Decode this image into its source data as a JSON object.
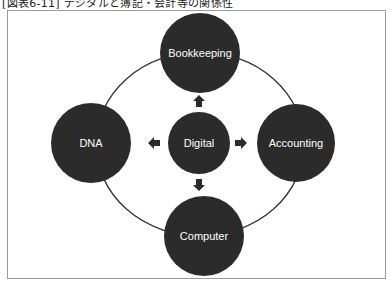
{
  "figure": {
    "title": "[図表6-11] デジタルと簿記・会計等の関係性"
  },
  "diagram": {
    "center_node": {
      "label": "Digital"
    },
    "outer_nodes": [
      {
        "id": "top",
        "label": "Bookkeeping"
      },
      {
        "id": "right",
        "label": "Accounting"
      },
      {
        "id": "bottom",
        "label": "Computer"
      },
      {
        "id": "left",
        "label": "DNA"
      }
    ],
    "arrows": [
      {
        "from": "Digital",
        "to": "Bookkeeping",
        "direction": "up"
      },
      {
        "from": "Digital",
        "to": "Accounting",
        "direction": "right"
      },
      {
        "from": "Digital",
        "to": "Computer",
        "direction": "down"
      },
      {
        "from": "Digital",
        "to": "DNA",
        "direction": "left"
      }
    ],
    "colors": {
      "node_fill": "#2b2b2b",
      "node_text": "#ffffff",
      "ring_stroke": "#333333",
      "frame_border": "#9a9a9a"
    }
  }
}
